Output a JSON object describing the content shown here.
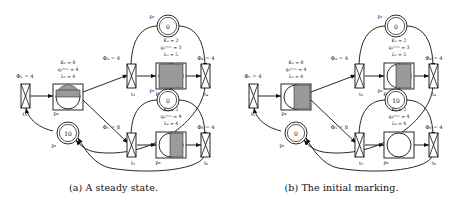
{
  "figure": {
    "type": "petri-net-diagram-pair",
    "panels": [
      {
        "id": "a",
        "caption": "(a) A steady state.",
        "modules": [
          {
            "id": "module-1",
            "position": "left",
            "input_transition": {
              "label": "t1",
              "rate_label": "Φ₁ = 4"
            },
            "place": {
              "label": "p₄",
              "kind": "fluid-place"
            },
            "parameters": [
              "K₂ = 8",
              "q₂ᵐᵃˣ = 4",
              "λ₂ = 4"
            ],
            "fill_level": 0.5,
            "fill_style": "half"
          },
          {
            "id": "module-2",
            "position": "top-right",
            "marking_place": {
              "label": "p₂",
              "tokens": "0"
            },
            "input_transition": {
              "label": "t₃",
              "rate_label": "Φ₃ = 4"
            },
            "output_transition": {
              "label": "t₄",
              "rate_label": "Φ₄ = 4"
            },
            "place": {
              "label": "p₅",
              "kind": "fluid-place"
            },
            "parameters": [
              "K₃ = 2",
              "q₃ᵐᵃˣ = 3",
              "λ₃ = 5"
            ],
            "fill_level": 1.0,
            "fill_style": "full"
          },
          {
            "id": "module-3",
            "position": "bottom-right",
            "marking_place": {
              "label": "p₃",
              "tokens": "0"
            },
            "input_transition": {
              "label": "t₅",
              "rate_label": "Φ₅ = 8"
            },
            "output_transition": {
              "label": "t₆",
              "rate_label": "Φ₆ = 4"
            },
            "place": {
              "label": "p₆",
              "kind": "fluid-place"
            },
            "parameters": [
              "K₄ = 2",
              "q₄ᵐᵃˣ = 4",
              "λ₄ = 4"
            ],
            "fill_level": 0.62,
            "fill_style": "partial"
          }
        ],
        "token_places": [
          {
            "label": "p₁",
            "tokens": "10",
            "position": "left-lower"
          }
        ]
      },
      {
        "id": "b",
        "caption": "(b) The initial marking.",
        "modules": [
          {
            "id": "module-1",
            "position": "left",
            "input_transition": {
              "label": "t₁",
              "rate_label": "Φ₁ = 4"
            },
            "place": {
              "label": "p₄",
              "kind": "fluid-place"
            },
            "parameters": [
              "K₂ = 8",
              "q₂ᵐᵃˣ = 4",
              "λ₂ = 4"
            ],
            "fill_level": 0.75,
            "fill_style": "full"
          },
          {
            "id": "module-2",
            "position": "top-right",
            "marking_place": {
              "label": "p₂",
              "tokens": "0"
            },
            "input_transition": {
              "label": "t₃",
              "rate_label": "Φ₃ = 4"
            },
            "output_transition": {
              "label": "t₄",
              "rate_label": "Φ₄ = 4"
            },
            "place": {
              "label": "p₅",
              "kind": "fluid-place"
            },
            "parameters": [
              "K₃ = 2",
              "q₃ᵐᵃˣ = 3",
              "λ₃ = 5"
            ],
            "fill_level": 0.6,
            "fill_style": "partial"
          },
          {
            "id": "module-3",
            "position": "bottom-right",
            "marking_place": {
              "label": "p₃",
              "tokens": "10"
            },
            "input_transition": {
              "label": "t₅",
              "rate_label": "Φ₅ = 8"
            },
            "output_transition": {
              "label": "t₆",
              "rate_label": "Φ₆ = 4"
            },
            "place": {
              "label": "p₆",
              "kind": "fluid-place"
            },
            "parameters": [
              "K₄ = 2",
              "q₄ᵐᵃˣ = 4",
              "λ₄ = 4"
            ],
            "fill_level": 0.0,
            "fill_style": "empty"
          }
        ],
        "token_places": [
          {
            "label": "p₁",
            "tokens": "0",
            "position": "left-lower"
          }
        ]
      }
    ],
    "colors": {
      "stroke": "#111111",
      "fill_gray": "#9a9a9a",
      "background": "#ffffff"
    }
  }
}
